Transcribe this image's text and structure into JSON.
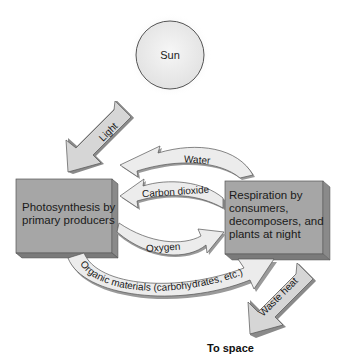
{
  "diagram": {
    "nodes": {
      "sun": {
        "label": "Sun"
      },
      "photosynthesis": {
        "label_lines": [
          "Photosynthesis by",
          "primary producers"
        ]
      },
      "respiration": {
        "label_lines": [
          "Respiration by",
          "consumers,",
          "decomposers, and",
          "plants at night"
        ]
      },
      "space": {
        "label": "To space"
      }
    },
    "arrows": {
      "light": {
        "label": "Light",
        "from": "sun",
        "to": "photosynthesis"
      },
      "water": {
        "label": "Water",
        "from": "respiration",
        "to": "photosynthesis"
      },
      "carbon_dioxide": {
        "label": "Carbon dioxide",
        "from": "respiration",
        "to": "photosynthesis"
      },
      "oxygen": {
        "label": "Oxygen",
        "from": "photosynthesis",
        "to": "respiration"
      },
      "organic": {
        "label": "Organic materials (carbohydrates, etc.)",
        "from": "photosynthesis",
        "to": "respiration"
      },
      "waste_heat": {
        "label": "Waste heat",
        "from": "respiration",
        "to": "space"
      }
    },
    "colors": {
      "box_face": "#a3a3a3",
      "box_side": "#7a7a7a",
      "arrow_fill": "#e6e6e6",
      "arrow_shadow": "#9a9a9a",
      "straight_arrow_fill": "#d0d0d0",
      "sun_fill": "#ededed"
    }
  }
}
